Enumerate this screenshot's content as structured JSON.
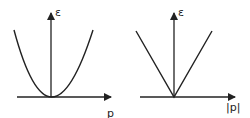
{
  "panels": [
    {
      "name": "quadratic-dispersion",
      "y_label": "ε",
      "x_label": "p",
      "curve": "parabola"
    },
    {
      "name": "linear-dispersion",
      "y_label": "ε",
      "x_label": "|p|",
      "curve": "v-shape"
    }
  ],
  "colors": {
    "line": "#222222",
    "background": "#ffffff"
  }
}
